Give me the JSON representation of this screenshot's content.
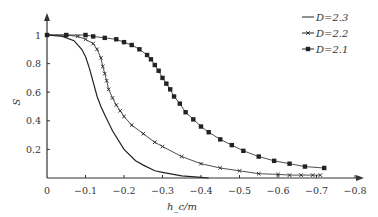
{
  "chart_data": {
    "type": "line",
    "title": "",
    "xlabel": "h_c/m",
    "ylabel": "S",
    "xlim": [
      0,
      -0.8
    ],
    "ylim": [
      0,
      1.1
    ],
    "grid": false,
    "legend_position": "top-right",
    "x_ticks": [
      "0",
      "−0.1",
      "−0.2",
      "−0.3",
      "−0.4",
      "−0.5",
      "−0.6",
      "−0.7",
      "−0.8"
    ],
    "y_ticks": [
      "0.2",
      "0.4",
      "0.6",
      "0.8",
      "1"
    ],
    "series": [
      {
        "name": "D=2.3",
        "marker": "none",
        "x": [
          0,
          -0.04,
          -0.07,
          -0.09,
          -0.1,
          -0.11,
          -0.12,
          -0.13,
          -0.14,
          -0.15,
          -0.17,
          -0.2,
          -0.23,
          -0.25,
          -0.28,
          -0.3,
          -0.35,
          -0.4,
          -0.42
        ],
        "y": [
          1,
          0.99,
          0.96,
          0.9,
          0.85,
          0.77,
          0.67,
          0.57,
          0.5,
          0.44,
          0.33,
          0.2,
          0.12,
          0.09,
          0.05,
          0.04,
          0.015,
          0.005,
          0
        ]
      },
      {
        "name": "D=2.2",
        "marker": "x",
        "x": [
          0,
          -0.05,
          -0.08,
          -0.1,
          -0.12,
          -0.13,
          -0.14,
          -0.145,
          -0.15,
          -0.155,
          -0.16,
          -0.17,
          -0.18,
          -0.19,
          -0.2,
          -0.22,
          -0.25,
          -0.28,
          -0.3,
          -0.35,
          -0.4,
          -0.45,
          -0.5,
          -0.55,
          -0.6,
          -0.63,
          -0.66,
          -0.69,
          -0.71
        ],
        "y": [
          1,
          1,
          0.99,
          0.97,
          0.94,
          0.9,
          0.84,
          0.78,
          0.73,
          0.68,
          0.62,
          0.56,
          0.51,
          0.47,
          0.43,
          0.37,
          0.31,
          0.25,
          0.22,
          0.15,
          0.1,
          0.07,
          0.05,
          0.03,
          0.025,
          0.02,
          0.02,
          0.02,
          0.02
        ]
      },
      {
        "name": "D=2.1",
        "marker": "square",
        "x": [
          0,
          -0.05,
          -0.1,
          -0.12,
          -0.15,
          -0.18,
          -0.2,
          -0.22,
          -0.24,
          -0.26,
          -0.27,
          -0.28,
          -0.29,
          -0.3,
          -0.31,
          -0.32,
          -0.33,
          -0.345,
          -0.36,
          -0.38,
          -0.4,
          -0.42,
          -0.45,
          -0.48,
          -0.51,
          -0.55,
          -0.59,
          -0.63,
          -0.67,
          -0.72
        ],
        "y": [
          1,
          1,
          1,
          0.99,
          0.98,
          0.97,
          0.95,
          0.93,
          0.9,
          0.86,
          0.83,
          0.79,
          0.75,
          0.7,
          0.66,
          0.62,
          0.57,
          0.52,
          0.46,
          0.41,
          0.36,
          0.32,
          0.27,
          0.23,
          0.19,
          0.15,
          0.12,
          0.1,
          0.08,
          0.07
        ]
      }
    ]
  },
  "legend": [
    {
      "label": "D=2.3",
      "marker": "none"
    },
    {
      "label": "D=2.2",
      "marker": "x"
    },
    {
      "label": "D=2.1",
      "marker": "square"
    }
  ]
}
